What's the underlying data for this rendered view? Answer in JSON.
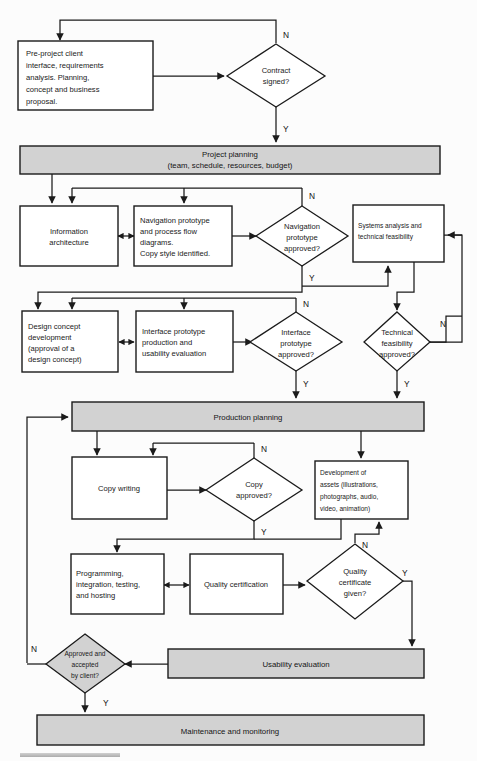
{
  "diagram": {
    "colors": {
      "band_fill": "#d2d2d2",
      "box_fill": "#ffffff",
      "stroke": "#1b1b1b"
    },
    "nodes": {
      "pre_project": {
        "lines": [
          "Pre-project client",
          "interface, requirements",
          "analysis.  Planning,",
          "concept and business",
          "proposal."
        ]
      },
      "contract_signed": {
        "lines": [
          "Contract",
          "signed?"
        ]
      },
      "project_planning": {
        "lines": [
          "Project planning",
          "(team, schedule, resources, budget)"
        ]
      },
      "information_architecture": {
        "lines": [
          "Information",
          "architecture"
        ]
      },
      "navigation_prototype": {
        "lines": [
          "Navigation prototype",
          "and process flow",
          "diagrams.",
          "Copy style identified."
        ]
      },
      "navigation_approved": {
        "lines": [
          "Navigation",
          "prototype",
          "approved?"
        ]
      },
      "systems_analysis": {
        "lines": [
          "Systems analysis and",
          "technical feasibility"
        ]
      },
      "design_concept": {
        "lines": [
          "Design concept",
          "development",
          "(approval of a",
          "design concept)"
        ]
      },
      "interface_prototype": {
        "lines": [
          "Interface prototype",
          "production and",
          "usability  evaluation"
        ]
      },
      "interface_approved": {
        "lines": [
          "Interface",
          "prototype",
          "approved?"
        ]
      },
      "technical_feasibility_approved": {
        "lines": [
          "Technical",
          "feasibility",
          "approved?"
        ]
      },
      "production_planning": {
        "lines": [
          "Production planning"
        ]
      },
      "copy_writing": {
        "lines": [
          "Copy writing"
        ]
      },
      "copy_approved": {
        "lines": [
          "Copy",
          "approved?"
        ]
      },
      "development_assets": {
        "lines": [
          "Development of",
          "assets (illustrations,",
          "photographs, audio,",
          "video, animation)"
        ]
      },
      "programming": {
        "lines": [
          "Programming,",
          "integration, testing,",
          "and hosting"
        ]
      },
      "quality_certification": {
        "lines": [
          "Quality certification"
        ]
      },
      "quality_certificate_given": {
        "lines": [
          "Quality",
          "certificate",
          "given?"
        ]
      },
      "approved_by_client": {
        "lines": [
          "Approved and",
          "accepted",
          "by client?"
        ]
      },
      "usability_evaluation": {
        "lines": [
          "Usability evaluation"
        ]
      },
      "maintenance": {
        "lines": [
          "Maintenance and monitoring"
        ]
      }
    },
    "edge_labels": {
      "contract_n": "N",
      "contract_y": "Y",
      "navigation_n": "N",
      "navigation_y": "Y",
      "interface_n": "N",
      "interface_y": "Y",
      "technical_n": "N",
      "technical_y": "Y",
      "copy_n": "N",
      "copy_y": "Y",
      "quality_n": "N",
      "quality_y": "Y",
      "client_n": "N",
      "client_y": "Y"
    }
  }
}
